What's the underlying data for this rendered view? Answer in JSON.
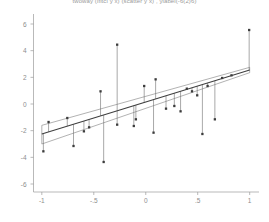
{
  "chart_data": {
    "type": "scatter",
    "title": "twoway (lfitci y x) (scatter y x) , ylabel(-6(2)6)",
    "xlabel": "",
    "ylabel": "",
    "xlim": [
      -1.08,
      1.08
    ],
    "ylim": [
      -6.6,
      6.6
    ],
    "xticks": [
      -1,
      -0.5,
      0,
      0.5,
      1
    ],
    "xticklabels": [
      "-1",
      "-.5",
      "0",
      ".5",
      "1"
    ],
    "yticks": [
      -6,
      -4,
      -2,
      0,
      2,
      4,
      6
    ],
    "yticklabels": [
      "-6",
      "-4",
      "-2",
      "0",
      "2",
      "4",
      "6"
    ],
    "grid": false,
    "legend": "none",
    "series": [
      {
        "name": "fitted line",
        "type": "line",
        "color": "#4d4d4d",
        "x": [
          -1.0,
          1.0
        ],
        "y": [
          -2.25,
          2.55
        ]
      },
      {
        "name": "ci upper",
        "type": "line",
        "color": "#777777",
        "x": [
          -1.0,
          1.0
        ],
        "y": [
          -1.6,
          2.75
        ]
      },
      {
        "name": "ci lower",
        "type": "line",
        "color": "#777777",
        "x": [
          -1.0,
          1.0
        ],
        "y": [
          -3.0,
          2.35
        ]
      },
      {
        "name": "observations",
        "type": "scatter",
        "color": "#3c3c3c",
        "points": [
          {
            "x": -0.985,
            "y": -3.55
          },
          {
            "x": -0.935,
            "y": -1.35
          },
          {
            "x": -0.755,
            "y": -1.05
          },
          {
            "x": -0.695,
            "y": -3.15
          },
          {
            "x": -0.595,
            "y": -2.05
          },
          {
            "x": -0.545,
            "y": -1.75
          },
          {
            "x": -0.435,
            "y": 0.95
          },
          {
            "x": -0.405,
            "y": -4.35
          },
          {
            "x": -0.275,
            "y": 4.45
          },
          {
            "x": -0.275,
            "y": -1.55
          },
          {
            "x": -0.115,
            "y": -1.65
          },
          {
            "x": -0.095,
            "y": -1.15
          },
          {
            "x": -0.015,
            "y": 1.35
          },
          {
            "x": 0.075,
            "y": -2.15
          },
          {
            "x": 0.095,
            "y": 1.85
          },
          {
            "x": 0.195,
            "y": -0.35
          },
          {
            "x": 0.275,
            "y": -0.15
          },
          {
            "x": 0.335,
            "y": -0.55
          },
          {
            "x": 0.395,
            "y": 1.15
          },
          {
            "x": 0.445,
            "y": 0.95
          },
          {
            "x": 0.495,
            "y": 0.65
          },
          {
            "x": 0.545,
            "y": -2.25
          },
          {
            "x": 0.595,
            "y": 1.35
          },
          {
            "x": 0.665,
            "y": -1.15
          },
          {
            "x": 0.735,
            "y": 1.95
          },
          {
            "x": 0.825,
            "y": 2.15
          },
          {
            "x": 0.995,
            "y": 5.55
          }
        ]
      }
    ]
  }
}
